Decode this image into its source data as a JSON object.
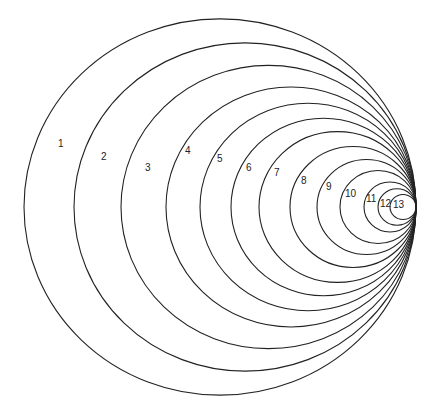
{
  "diagram": {
    "tangent_point": {
      "x": 416,
      "y": 207
    },
    "stroke_color": "#222222",
    "background": "#ffffff",
    "circles": [
      {
        "label": "1",
        "left_x": 24,
        "label_pos": [
          58,
          147
        ]
      },
      {
        "label": "2",
        "left_x": 74,
        "label_pos": [
          101,
          160
        ]
      },
      {
        "label": "3",
        "left_x": 121,
        "label_pos": [
          145,
          171
        ]
      },
      {
        "label": "4",
        "left_x": 166,
        "label_pos": [
          185,
          154
        ]
      },
      {
        "label": "5",
        "left_x": 200,
        "label_pos": [
          217,
          162
        ]
      },
      {
        "label": "6",
        "left_x": 231,
        "label_pos": [
          246,
          171
        ]
      },
      {
        "label": "7",
        "left_x": 259,
        "label_pos": [
          274,
          176
        ]
      },
      {
        "label": "8",
        "left_x": 290,
        "label_pos": [
          301,
          184
        ]
      },
      {
        "label": "9",
        "left_x": 317,
        "label_pos": [
          326,
          190
        ]
      },
      {
        "label": "10",
        "left_x": 340,
        "label_pos": [
          345,
          197
        ]
      },
      {
        "label": "11",
        "left_x": 364,
        "label_pos": [
          366,
          202
        ]
      },
      {
        "label": "12",
        "left_x": 378,
        "label_pos": [
          380,
          207
        ]
      },
      {
        "label": "13",
        "left_x": 390,
        "label_pos": [
          393,
          208
        ]
      }
    ],
    "vertical_scale": 0.96
  }
}
